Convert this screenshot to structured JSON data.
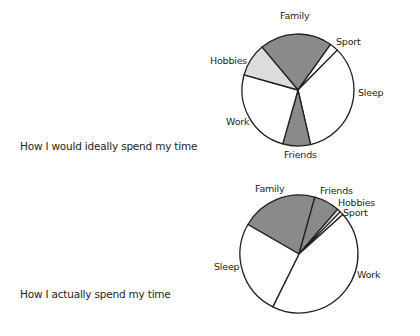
{
  "chart_data": [
    {
      "type": "pie",
      "title": "How I would ideally spend my time",
      "labels": [
        "Family",
        "Sport",
        "Sleep",
        "Friends",
        "Work",
        "Hobbies"
      ],
      "values": [
        21,
        2.5,
        34,
        8,
        25,
        9.5
      ],
      "colors": [
        "#8a8a8a",
        "#ffffff",
        "#ffffff",
        "#8a8a8a",
        "#ffffff",
        "#dcdcdc"
      ],
      "start_angle_deg": -40,
      "direction": "clockwise",
      "legend": "none (direct labels)"
    },
    {
      "type": "pie",
      "title": "How I actually spend my time",
      "labels": [
        "Family",
        "Friends",
        "Hobbies",
        "Sport",
        "Work",
        "Sleep"
      ],
      "values": [
        21,
        7,
        1,
        1,
        44,
        26
      ],
      "colors": [
        "#8a8a8a",
        "#8a8a8a",
        "#dcdcdc",
        "#ffffff",
        "#ffffff",
        "#ffffff"
      ],
      "start_angle_deg": -60,
      "direction": "clockwise",
      "legend": "none (direct labels)"
    }
  ],
  "captions": {
    "ideal": "How I would ideally spend my time",
    "actual": "How I actually spend my time"
  },
  "labels": {
    "ideal": {
      "family": "Family",
      "sport": "Sport",
      "sleep": "Sleep",
      "friends": "Friends",
      "work": "Work",
      "hobbies": "Hobbies"
    },
    "actual": {
      "family": "Family",
      "friends": "Friends",
      "hobbies": "Hobbies",
      "sport": "Sport",
      "work": "Work",
      "sleep": "Sleep"
    }
  }
}
